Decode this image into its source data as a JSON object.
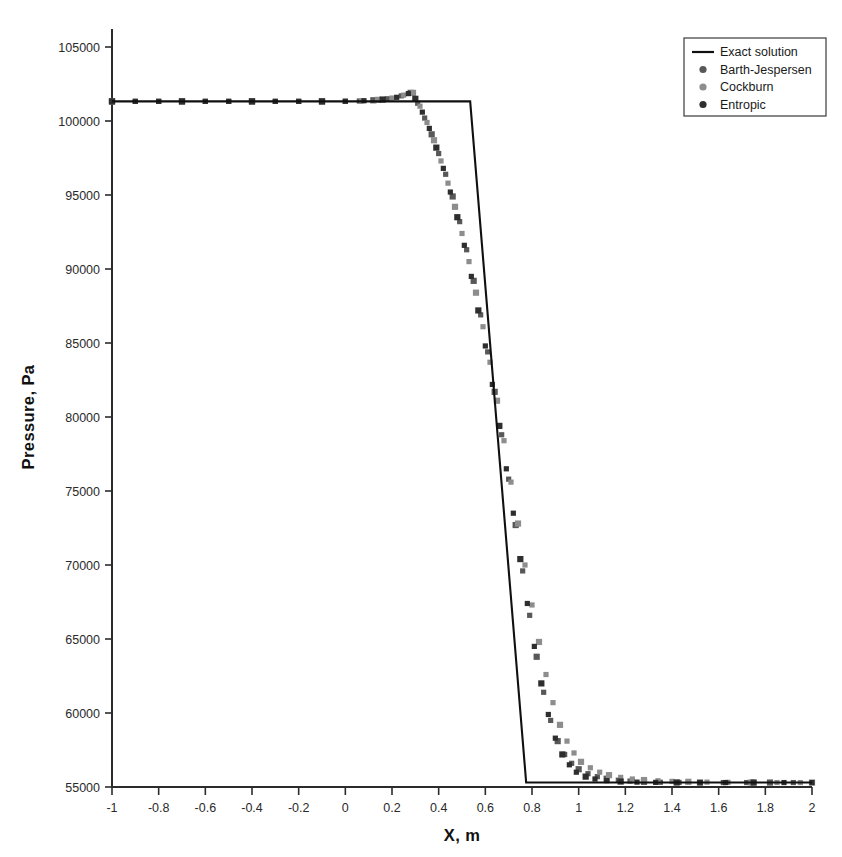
{
  "chart_data": {
    "type": "scatter",
    "title": "",
    "xlabel": "X, m",
    "ylabel": "Pressure, Pa",
    "xlim": [
      -1,
      2
    ],
    "ylim": [
      55000,
      105000
    ],
    "xticks": [
      -1,
      -0.8,
      -0.6,
      -0.4,
      -0.2,
      0,
      0.2,
      0.4,
      0.6,
      0.8,
      1,
      1.2,
      1.4,
      1.6,
      1.8,
      2
    ],
    "xtick_labels": [
      "-1",
      "-0.8",
      "-0.6",
      "-0.4",
      "-0.2",
      "0",
      "0.2",
      "0.4",
      "0.6",
      "0.8",
      "1",
      "1.2",
      "1.4",
      "1.6",
      "1.8",
      "2"
    ],
    "yticks": [
      55000,
      60000,
      65000,
      70000,
      75000,
      80000,
      85000,
      90000,
      95000,
      100000,
      105000
    ],
    "ytick_labels": [
      "55000",
      "60000",
      "65000",
      "70000",
      "75000",
      "80000",
      "85000",
      "90000",
      "95000",
      "100000",
      "105000"
    ],
    "grid": false,
    "legend_position": "top-right",
    "plateau_pressure": 101325,
    "tail_pressure": 55300,
    "series": [
      {
        "name": "Exact solution",
        "style": "line",
        "color": "#101010",
        "x": [
          -1,
          0.535,
          0.775,
          2
        ],
        "values": [
          101325,
          101325,
          55300,
          55300
        ]
      },
      {
        "name": "Barth-Jespersen",
        "style": "marker",
        "color": "#585858",
        "marker": "square",
        "x": [
          -1.0,
          -0.9,
          -0.8,
          -0.7,
          -0.6,
          -0.5,
          -0.4,
          -0.3,
          -0.2,
          -0.1,
          0.0,
          0.06,
          0.12,
          0.18,
          0.24,
          0.28,
          0.31,
          0.34,
          0.37,
          0.4,
          0.43,
          0.46,
          0.49,
          0.52,
          0.55,
          0.58,
          0.61,
          0.64,
          0.67,
          0.7,
          0.73,
          0.76,
          0.79,
          0.82,
          0.85,
          0.88,
          0.91,
          0.94,
          0.97,
          1.0,
          1.04,
          1.08,
          1.12,
          1.17,
          1.22,
          1.28,
          1.35,
          1.43,
          1.52,
          1.62,
          1.72,
          1.82,
          1.92,
          2.0
        ],
        "values": [
          101325,
          101325,
          101325,
          101325,
          101325,
          101325,
          101325,
          101325,
          101325,
          101325,
          101330,
          101350,
          101400,
          101500,
          101700,
          101900,
          101200,
          100200,
          99100,
          97800,
          96400,
          94900,
          93200,
          91300,
          89200,
          86900,
          84400,
          81700,
          78800,
          75800,
          72700,
          69600,
          66600,
          63800,
          61400,
          59500,
          58100,
          57200,
          56600,
          56200,
          55900,
          55700,
          55560,
          55460,
          55400,
          55350,
          55320,
          55310,
          55300,
          55300,
          55300,
          55300,
          55300,
          55300
        ]
      },
      {
        "name": "Cockburn",
        "style": "marker",
        "color": "#8d8d8d",
        "marker": "square",
        "x": [
          -1.0,
          -0.9,
          -0.8,
          -0.7,
          -0.6,
          -0.5,
          -0.4,
          -0.3,
          -0.2,
          -0.1,
          0.0,
          0.07,
          0.14,
          0.2,
          0.25,
          0.29,
          0.32,
          0.35,
          0.38,
          0.41,
          0.44,
          0.47,
          0.5,
          0.53,
          0.56,
          0.59,
          0.62,
          0.65,
          0.68,
          0.71,
          0.74,
          0.77,
          0.8,
          0.83,
          0.86,
          0.89,
          0.92,
          0.95,
          0.98,
          1.01,
          1.05,
          1.09,
          1.13,
          1.18,
          1.23,
          1.28,
          1.34,
          1.4,
          1.47,
          1.55,
          1.64,
          1.74,
          1.85,
          1.95,
          2.0
        ],
        "values": [
          101325,
          101325,
          101325,
          101325,
          101325,
          101325,
          101325,
          101325,
          101325,
          101325,
          101330,
          101360,
          101430,
          101550,
          101750,
          101900,
          101000,
          99900,
          98700,
          97300,
          95800,
          94200,
          92400,
          90500,
          88400,
          86100,
          83700,
          81100,
          78400,
          75600,
          72800,
          70000,
          67300,
          64800,
          62600,
          60700,
          59200,
          58100,
          57300,
          56700,
          56300,
          56000,
          55800,
          55650,
          55540,
          55470,
          55420,
          55380,
          55350,
          55330,
          55315,
          55305,
          55300,
          55300,
          55300
        ]
      },
      {
        "name": "Entropic",
        "style": "marker",
        "color": "#2e2e2e",
        "marker": "square",
        "x": [
          -1.0,
          -0.9,
          -0.8,
          -0.7,
          -0.6,
          -0.5,
          -0.4,
          -0.3,
          -0.2,
          -0.1,
          0.0,
          0.08,
          0.16,
          0.22,
          0.27,
          0.3,
          0.33,
          0.36,
          0.39,
          0.42,
          0.45,
          0.48,
          0.51,
          0.54,
          0.57,
          0.6,
          0.63,
          0.66,
          0.69,
          0.72,
          0.75,
          0.78,
          0.81,
          0.84,
          0.87,
          0.9,
          0.93,
          0.96,
          0.99,
          1.03,
          1.07,
          1.12,
          1.18,
          1.25,
          1.33,
          1.42,
          1.52,
          1.63,
          1.75,
          1.88,
          2.0
        ],
        "values": [
          101325,
          101325,
          101325,
          101325,
          101325,
          101325,
          101325,
          101325,
          101325,
          101325,
          101330,
          101370,
          101450,
          101600,
          101850,
          101500,
          100600,
          99500,
          98200,
          96800,
          95200,
          93500,
          91600,
          89500,
          87200,
          84800,
          82200,
          79400,
          76500,
          73500,
          70400,
          67400,
          64500,
          62000,
          59900,
          58300,
          57200,
          56500,
          56000,
          55700,
          55540,
          55430,
          55370,
          55330,
          55312,
          55305,
          55300,
          55300,
          55300,
          55300,
          55300
        ]
      }
    ],
    "legend_entries": [
      {
        "label": "Exact solution",
        "style": "line",
        "color": "#101010"
      },
      {
        "label": "Barth-Jespersen",
        "style": "dot",
        "color": "#585858"
      },
      {
        "label": "Cockburn",
        "style": "dot",
        "color": "#8d8d8d"
      },
      {
        "label": "Entropic",
        "style": "dot",
        "color": "#2e2e2e"
      }
    ]
  }
}
